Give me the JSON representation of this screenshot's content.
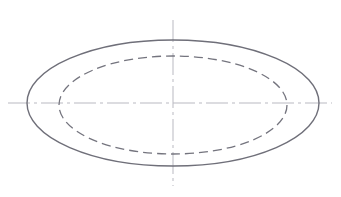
{
  "document": {
    "title": "Ellipse Technical Drawing",
    "type": "engineering-line-drawing",
    "background_color": "#ffffff",
    "width": 341,
    "height": 197
  },
  "chart_data": {
    "type": "scatter",
    "xlabel": "",
    "ylabel": "",
    "xlim": [
      0,
      341
    ],
    "ylim": [
      0,
      197
    ],
    "grid": false,
    "legend": null,
    "annotations": [],
    "shapes": [
      {
        "name": "outer-ellipse",
        "kind": "ellipse",
        "style": "solid",
        "cx": 173,
        "cy": 103,
        "rx": 146,
        "ry": 63,
        "stroke": "#6f6f79",
        "stroke_width": 1.4,
        "fill": "none"
      },
      {
        "name": "inner-ellipse",
        "kind": "ellipse",
        "style": "dashed",
        "cx": 173,
        "cy": 105,
        "rx": 114,
        "ry": 49,
        "stroke": "#74747e",
        "stroke_width": 1.3,
        "fill": "none",
        "dash_pattern": "9 5"
      },
      {
        "name": "horizontal-centerline",
        "kind": "line",
        "style": "dash-dot",
        "x1": 8,
        "y1": 103,
        "x2": 332,
        "y2": 103,
        "stroke": "#b9b9c1",
        "stroke_width": 1,
        "dash_pattern": "22 4 3 4"
      },
      {
        "name": "vertical-centerline",
        "kind": "line",
        "style": "dash-dot",
        "x1": 173,
        "y1": 20,
        "x2": 173,
        "y2": 186,
        "stroke": "#b9b9c1",
        "stroke_width": 1,
        "dash_pattern": "22 4 3 4"
      }
    ],
    "center_point": {
      "x": 173,
      "y": 103
    }
  },
  "colors": {
    "outer_stroke": "#6f6f79",
    "inner_stroke": "#74747e",
    "centerline_stroke": "#b9b9c1",
    "background": "#ffffff"
  }
}
